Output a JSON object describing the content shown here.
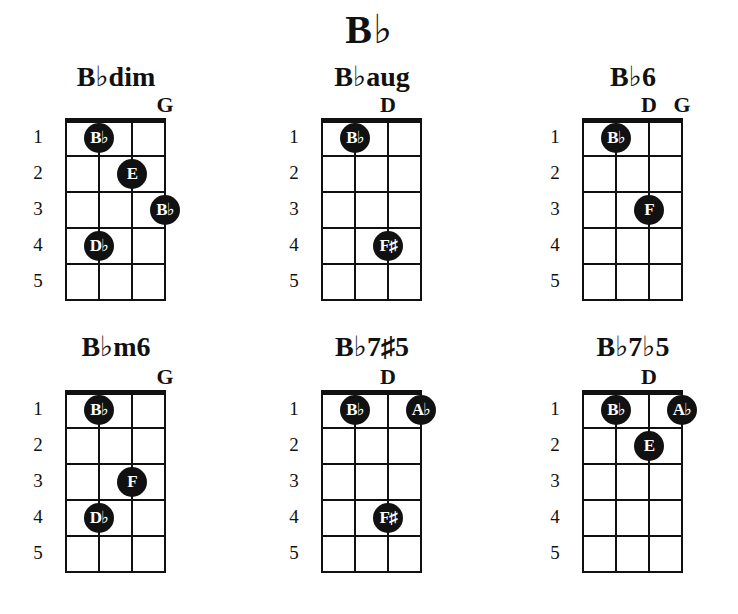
{
  "title": "B♭",
  "fret_numbers": [
    "1",
    "2",
    "3",
    "4",
    "5"
  ],
  "chords": [
    {
      "name": "B♭dim",
      "open_strings": [
        {
          "string": 4,
          "label": "G"
        }
      ],
      "dots": [
        {
          "string": 2,
          "fret": 1,
          "label": "B♭"
        },
        {
          "string": 3,
          "fret": 2,
          "label": "E"
        },
        {
          "string": 4,
          "fret": 3,
          "label": "B♭"
        },
        {
          "string": 2,
          "fret": 4,
          "label": "D♭"
        }
      ]
    },
    {
      "name": "B♭aug",
      "open_strings": [
        {
          "string": 3,
          "label": "D"
        }
      ],
      "dots": [
        {
          "string": 2,
          "fret": 1,
          "label": "B♭"
        },
        {
          "string": 3,
          "fret": 4,
          "label": "F♯"
        }
      ]
    },
    {
      "name": "B♭6",
      "open_strings": [
        {
          "string": 3,
          "label": "D"
        },
        {
          "string": 4,
          "label": "G"
        }
      ],
      "dots": [
        {
          "string": 2,
          "fret": 1,
          "label": "B♭"
        },
        {
          "string": 3,
          "fret": 3,
          "label": "F"
        }
      ]
    },
    {
      "name": "B♭m6",
      "open_strings": [
        {
          "string": 4,
          "label": "G"
        }
      ],
      "dots": [
        {
          "string": 2,
          "fret": 1,
          "label": "B♭"
        },
        {
          "string": 3,
          "fret": 3,
          "label": "F"
        },
        {
          "string": 2,
          "fret": 4,
          "label": "D♭"
        }
      ]
    },
    {
      "name": "B♭7♯5",
      "open_strings": [
        {
          "string": 3,
          "label": "D"
        }
      ],
      "dots": [
        {
          "string": 2,
          "fret": 1,
          "label": "B♭"
        },
        {
          "string": 4,
          "fret": 1,
          "label": "A♭"
        },
        {
          "string": 3,
          "fret": 4,
          "label": "F♯"
        }
      ]
    },
    {
      "name": "B♭7♭5",
      "open_strings": [
        {
          "string": 3,
          "label": "D"
        }
      ],
      "dots": [
        {
          "string": 2,
          "fret": 1,
          "label": "B♭"
        },
        {
          "string": 4,
          "fret": 1,
          "label": "A♭"
        },
        {
          "string": 3,
          "fret": 2,
          "label": "E"
        }
      ]
    }
  ],
  "colors": {
    "ink": "#111111",
    "background": "#ffffff",
    "dot_text": "#ffffff"
  }
}
